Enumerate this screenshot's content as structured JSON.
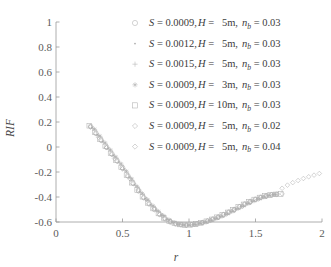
{
  "chart_data": {
    "type": "scatter",
    "title": "",
    "xlabel": "r",
    "ylabel": "RIF",
    "xlim": [
      0,
      2
    ],
    "ylim": [
      -0.6,
      1
    ],
    "xticks": [
      "0",
      "0.5",
      "1",
      "1.5",
      "2"
    ],
    "xtick_values": [
      0,
      0.5,
      1,
      1.5,
      2
    ],
    "yticks": [
      "1",
      "0.8",
      "0.6",
      "0.4",
      "0.2",
      "0",
      "-0.2",
      "-0.4",
      "-0.6"
    ],
    "ytick_values": [
      1,
      0.8,
      0.6,
      0.4,
      0.2,
      0,
      -0.2,
      -0.4,
      -0.6
    ],
    "grid": false,
    "legend_position": "upper-right-inside",
    "series": [
      {
        "name": "S = 0.0009, H = 5m, n_b = 0.03",
        "marker": "circle-open",
        "x": [
          0.26,
          0.3,
          0.34,
          0.38,
          0.42,
          0.46,
          0.5,
          0.54,
          0.58,
          0.62,
          0.66,
          0.7,
          0.74,
          0.78,
          0.82,
          0.86,
          0.9,
          0.94,
          0.98,
          1.02,
          1.06,
          1.1,
          1.14,
          1.18,
          1.22,
          1.26,
          1.3,
          1.34,
          1.38,
          1.42,
          1.46,
          1.5,
          1.54,
          1.58,
          1.62,
          1.66
        ],
        "y": [
          0.165,
          0.11,
          0.055,
          0.0,
          -0.055,
          -0.11,
          -0.165,
          -0.23,
          -0.29,
          -0.35,
          -0.405,
          -0.455,
          -0.5,
          -0.54,
          -0.575,
          -0.6,
          -0.615,
          -0.622,
          -0.625,
          -0.622,
          -0.615,
          -0.605,
          -0.592,
          -0.577,
          -0.56,
          -0.541,
          -0.521,
          -0.5,
          -0.478,
          -0.456,
          -0.436,
          -0.418,
          -0.402,
          -0.39,
          -0.382,
          -0.378
        ]
      },
      {
        "name": "S = 0.0012, H = 5m, n_b = 0.03",
        "marker": "dot",
        "x": [
          0.27,
          0.31,
          0.35,
          0.39,
          0.43,
          0.47,
          0.51,
          0.55,
          0.59,
          0.63,
          0.67,
          0.71,
          0.75,
          0.79,
          0.83,
          0.87,
          0.91,
          0.95,
          0.99,
          1.03,
          1.07,
          1.11,
          1.15,
          1.19,
          1.23,
          1.27,
          1.31,
          1.35,
          1.39,
          1.43,
          1.47,
          1.51,
          1.55,
          1.59,
          1.63
        ],
        "y": [
          0.155,
          0.1,
          0.045,
          -0.01,
          -0.065,
          -0.12,
          -0.178,
          -0.24,
          -0.3,
          -0.358,
          -0.412,
          -0.46,
          -0.504,
          -0.543,
          -0.577,
          -0.601,
          -0.616,
          -0.623,
          -0.625,
          -0.621,
          -0.614,
          -0.603,
          -0.59,
          -0.574,
          -0.557,
          -0.538,
          -0.518,
          -0.497,
          -0.475,
          -0.454,
          -0.434,
          -0.416,
          -0.401,
          -0.389,
          -0.381
        ]
      },
      {
        "name": "S = 0.0015, H = 5m, n_b = 0.03",
        "marker": "plus",
        "x": [
          0.28,
          0.32,
          0.36,
          0.4,
          0.44,
          0.48,
          0.52,
          0.56,
          0.6,
          0.64,
          0.68,
          0.72,
          0.76,
          0.8,
          0.84,
          0.88,
          0.92,
          0.96,
          1.0,
          1.04,
          1.08,
          1.12,
          1.16,
          1.2,
          1.24,
          1.28,
          1.32,
          1.36,
          1.4,
          1.44,
          1.48,
          1.52,
          1.56,
          1.6,
          1.64
        ],
        "y": [
          0.148,
          0.093,
          0.038,
          -0.018,
          -0.073,
          -0.128,
          -0.187,
          -0.248,
          -0.308,
          -0.365,
          -0.418,
          -0.466,
          -0.509,
          -0.547,
          -0.58,
          -0.603,
          -0.617,
          -0.624,
          -0.625,
          -0.62,
          -0.613,
          -0.602,
          -0.588,
          -0.572,
          -0.555,
          -0.536,
          -0.516,
          -0.494,
          -0.473,
          -0.452,
          -0.432,
          -0.415,
          -0.4,
          -0.388,
          -0.38
        ]
      },
      {
        "name": "S = 0.0009, H = 3m, n_b = 0.03",
        "marker": "star",
        "x": [
          0.29,
          0.33,
          0.37,
          0.41,
          0.45,
          0.49,
          0.53,
          0.57,
          0.61,
          0.65,
          0.69,
          0.73,
          0.77,
          0.81,
          0.85,
          0.89,
          0.93,
          0.97,
          1.01,
          1.05,
          1.09,
          1.13,
          1.17,
          1.21,
          1.25,
          1.29,
          1.33,
          1.37,
          1.41,
          1.45,
          1.49,
          1.53,
          1.57,
          1.61,
          1.65
        ],
        "y": [
          0.142,
          0.087,
          0.032,
          -0.024,
          -0.08,
          -0.136,
          -0.195,
          -0.256,
          -0.316,
          -0.372,
          -0.424,
          -0.471,
          -0.514,
          -0.551,
          -0.583,
          -0.605,
          -0.618,
          -0.624,
          -0.625,
          -0.62,
          -0.612,
          -0.601,
          -0.586,
          -0.57,
          -0.553,
          -0.534,
          -0.513,
          -0.492,
          -0.471,
          -0.45,
          -0.431,
          -0.414,
          -0.399,
          -0.387,
          -0.38
        ]
      },
      {
        "name": "S = 0.0009, H = 10m, n_b = 0.03",
        "marker": "square-open",
        "x": [
          0.25,
          0.29,
          0.33,
          0.37,
          0.41,
          0.45,
          0.49,
          0.53,
          0.57,
          0.61,
          0.65,
          0.69,
          0.73,
          0.77,
          0.81,
          0.85,
          0.89,
          0.93,
          0.97,
          1.01,
          1.05,
          1.09,
          1.13,
          1.17,
          1.21,
          1.25,
          1.29,
          1.33,
          1.37,
          1.41,
          1.45,
          1.49,
          1.53,
          1.57,
          1.61,
          1.65,
          1.69
        ],
        "y": [
          0.17,
          0.118,
          0.062,
          0.006,
          -0.05,
          -0.106,
          -0.163,
          -0.225,
          -0.286,
          -0.344,
          -0.398,
          -0.447,
          -0.492,
          -0.532,
          -0.567,
          -0.594,
          -0.611,
          -0.62,
          -0.624,
          -0.622,
          -0.616,
          -0.606,
          -0.594,
          -0.579,
          -0.562,
          -0.543,
          -0.523,
          -0.502,
          -0.48,
          -0.459,
          -0.439,
          -0.42,
          -0.404,
          -0.392,
          -0.384,
          -0.379,
          -0.376
        ]
      },
      {
        "name": "S = 0.0009, H = 5m, n_b = 0.02",
        "marker": "diamond-open",
        "x": [
          0.26,
          0.3,
          0.34,
          0.38,
          0.42,
          0.46,
          0.5,
          0.54,
          0.58,
          0.62,
          0.66,
          0.7,
          0.74,
          0.78,
          0.82,
          0.86,
          0.9,
          0.94,
          0.98,
          1.02,
          1.06,
          1.1,
          1.14,
          1.18,
          1.22,
          1.26,
          1.3,
          1.34,
          1.38,
          1.42,
          1.46,
          1.5,
          1.54,
          1.58,
          1.62,
          1.66,
          1.7
        ],
        "y": [
          0.16,
          0.106,
          0.05,
          -0.005,
          -0.06,
          -0.116,
          -0.172,
          -0.234,
          -0.294,
          -0.352,
          -0.406,
          -0.455,
          -0.5,
          -0.54,
          -0.574,
          -0.599,
          -0.614,
          -0.622,
          -0.625,
          -0.621,
          -0.615,
          -0.604,
          -0.591,
          -0.576,
          -0.559,
          -0.54,
          -0.52,
          -0.499,
          -0.477,
          -0.456,
          -0.436,
          -0.418,
          -0.403,
          -0.391,
          -0.383,
          -0.378,
          -0.375
        ]
      },
      {
        "name": "S = 0.0009, H = 5m, n_b = 0.04",
        "marker": "diamond-open-tail",
        "x": [
          0.26,
          0.32,
          0.38,
          0.44,
          0.5,
          0.56,
          0.62,
          0.68,
          0.74,
          0.8,
          0.86,
          0.92,
          0.98,
          1.04,
          1.1,
          1.16,
          1.22,
          1.28,
          1.34,
          1.4,
          1.46,
          1.52,
          1.58,
          1.64,
          1.7,
          1.74,
          1.78,
          1.82,
          1.86,
          1.9,
          1.94,
          1.98
        ],
        "y": [
          0.162,
          0.078,
          -0.006,
          -0.092,
          -0.175,
          -0.258,
          -0.34,
          -0.418,
          -0.489,
          -0.548,
          -0.594,
          -0.617,
          -0.625,
          -0.62,
          -0.606,
          -0.588,
          -0.563,
          -0.536,
          -0.505,
          -0.475,
          -0.444,
          -0.417,
          -0.395,
          -0.38,
          -0.33,
          -0.305,
          -0.285,
          -0.268,
          -0.252,
          -0.238,
          -0.225,
          -0.212
        ]
      }
    ]
  },
  "legend": {
    "rows": [
      {
        "marker": "circle-open",
        "s_label": "S",
        "s_value": "0.0009",
        "h_label": "H",
        "h_value": "5m",
        "n_label": "n",
        "n_sub": "b",
        "n_value": "0.03"
      },
      {
        "marker": "dot",
        "s_label": "S",
        "s_value": "0.0012",
        "h_label": "H",
        "h_value": "5m",
        "n_label": "n",
        "n_sub": "b",
        "n_value": "0.03"
      },
      {
        "marker": "plus",
        "s_label": "S",
        "s_value": "0.0015",
        "h_label": "H",
        "h_value": "5m",
        "n_label": "n",
        "n_sub": "b",
        "n_value": "0.03"
      },
      {
        "marker": "star",
        "s_label": "S",
        "s_value": "0.0009",
        "h_label": "H",
        "h_value": "3m",
        "n_label": "n",
        "n_sub": "b",
        "n_value": "0.03"
      },
      {
        "marker": "square-open",
        "s_label": "S",
        "s_value": "0.0009",
        "h_label": "H",
        "h_value": "10m",
        "n_label": "n",
        "n_sub": "b",
        "n_value": "0.03"
      },
      {
        "marker": "diamond-open",
        "s_label": "S",
        "s_value": "0.0009",
        "h_label": "H",
        "h_value": "5m",
        "n_label": "n",
        "n_sub": "b",
        "n_value": "0.02"
      },
      {
        "marker": "diamond-open-tail",
        "s_label": "S",
        "s_value": "0.0009",
        "h_label": "H",
        "h_value": "5m",
        "n_label": "n",
        "n_sub": "b",
        "n_value": "0.04"
      }
    ],
    "equals": "=",
    "comma": ","
  },
  "colors": {
    "axis": "#9a9a9a",
    "tick_text": "#5b5b5b",
    "marker": "#b0b0b0",
    "legend_text": "#3c3c3c",
    "background": "#ffffff"
  }
}
